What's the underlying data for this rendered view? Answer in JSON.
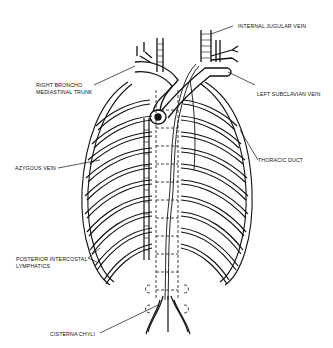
{
  "diagram": {
    "labels": [
      {
        "id": "internal-jugular-vein",
        "text": "INTERNAL JUGULAR VEIN"
      },
      {
        "id": "right-broncho-mediastinal-trunk",
        "line1": "RIGHT BRONCHO",
        "line2": "MEDIASTINAL TRUNK"
      },
      {
        "id": "left-subclavian-vein",
        "text": "LEFT SUBCLAVIAN VEIN"
      },
      {
        "id": "thoracic-duct",
        "text": "THORACIC DUCT"
      },
      {
        "id": "azygous-vein",
        "text": "AZYGOUS VEIN"
      },
      {
        "id": "posterior-intercostal-lymphatics",
        "line1": "POSTERIOR INTERCOSTAL",
        "line2": "LYMPHATICS"
      },
      {
        "id": "cisterna-chyli",
        "text": "CISTERNA CHYLI"
      }
    ],
    "colors": {
      "ink": "#111111",
      "background": "#ffffff"
    }
  }
}
